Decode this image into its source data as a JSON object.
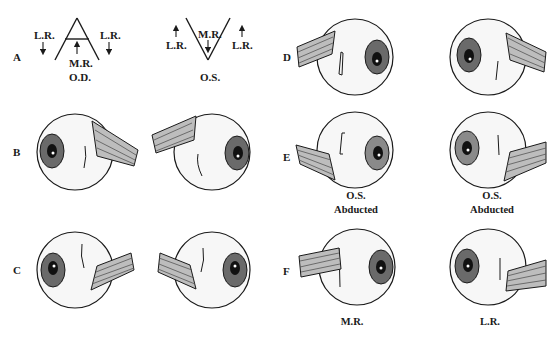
{
  "figure": {
    "panel_labels": [
      "A",
      "B",
      "C",
      "D",
      "E",
      "F"
    ],
    "panel_A": {
      "od": {
        "caption": "O.D.",
        "mr_label": "M.R.",
        "lr_left": "L.R.",
        "lr_right": "L.R.",
        "shape": "A-pattern"
      },
      "os": {
        "caption": "O.S.",
        "mr_label": "M.R.",
        "lr_left": "L.R.",
        "lr_right": "L.R.",
        "shape": "V-pattern"
      }
    },
    "panel_E": {
      "caption_left_1": "O.S.",
      "caption_left_2": "Abducted",
      "caption_right_1": "O.S.",
      "caption_right_2": "Abducted"
    },
    "panel_F": {
      "caption_left": "M.R.",
      "caption_right": "L.R."
    },
    "colors": {
      "ink": "#1a1a1a",
      "stipple": "#9a9a9a",
      "background": "#ffffff"
    }
  }
}
